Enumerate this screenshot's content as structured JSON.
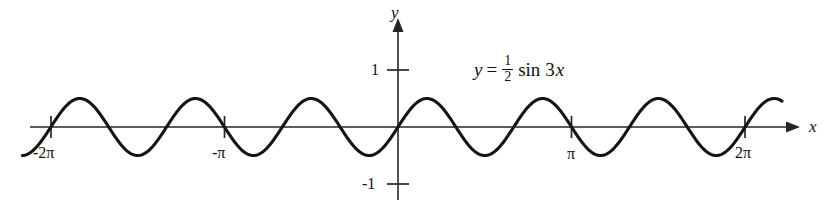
{
  "figure": {
    "kind": "cartesian-plot",
    "background_color": "#ffffff",
    "curve_color": "#141414",
    "axis_color": "#262626"
  },
  "axes": {
    "x_axis_label": "x",
    "y_axis_label": "y",
    "x_ticks": [
      {
        "label": "-2π",
        "value": -6.283185
      },
      {
        "label": "-π",
        "value": -3.141593
      },
      {
        "label": "π",
        "value": 3.141593
      },
      {
        "label": "2π",
        "value": 6.283185
      }
    ],
    "y_ticks": [
      {
        "label": "1",
        "value": 1
      },
      {
        "label": "-1",
        "value": -1
      }
    ]
  },
  "equation": {
    "lhs": "y",
    "operator": "=",
    "coefficient_numerator": "1",
    "coefficient_denominator": "2",
    "function": "sin",
    "argument_coefficient": "3",
    "argument_variable": "x",
    "plain": "y = 1/2 sin 3x"
  },
  "chart_data": {
    "type": "line",
    "title": "",
    "subtitle": "",
    "xlabel": "x",
    "ylabel": "y",
    "xlim": [
      -7.2,
      7.4
    ],
    "ylim": [
      -1.45,
      1.5
    ],
    "grid": false,
    "legend": null,
    "xticks": [
      -6.283185,
      -3.141593,
      3.141593,
      6.283185
    ],
    "xticklabels": [
      "-2π",
      "-π",
      "π",
      "2π"
    ],
    "yticks": [
      1,
      -1
    ],
    "yticklabels": [
      "1",
      "-1"
    ],
    "annotations": [
      {
        "text": "y = 1/2 sin 3x",
        "x": 1.1,
        "y": 1.0
      }
    ],
    "series": [
      {
        "name": "y = 1/2 sin 3x",
        "formula": "0.5*sin(3*x)",
        "amplitude": 0.5,
        "frequency": 3,
        "period": 2.0943951,
        "color": "#141414",
        "linewidth": 3.1,
        "x_domain": [
          -6.8,
          6.95
        ],
        "points_x": [
          -6.8,
          -6.28,
          -5.76,
          -5.24,
          -4.71,
          -4.19,
          -3.67,
          -3.14,
          -2.62,
          -2.09,
          -1.57,
          -1.05,
          -0.52,
          0,
          0.52,
          1.05,
          1.57,
          2.09,
          2.62,
          3.14,
          3.67,
          4.19,
          4.71,
          5.24,
          5.76,
          6.28,
          6.8
        ],
        "points_y": [
          -0.37,
          0.0,
          0.5,
          0.0,
          -0.5,
          0.0,
          0.5,
          0.0,
          -0.5,
          0.0,
          0.5,
          0.0,
          -0.5,
          0.0,
          0.5,
          0.0,
          -0.5,
          0.0,
          0.5,
          0.0,
          -0.5,
          0.0,
          0.5,
          0.0,
          -0.5,
          0.0,
          0.37
        ]
      }
    ]
  }
}
